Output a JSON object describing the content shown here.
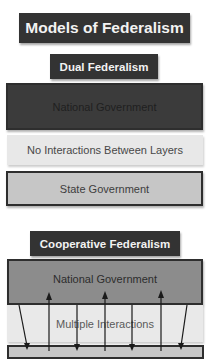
{
  "diagram": {
    "title": "Models of Federalism",
    "dual": {
      "label": "Dual Federalism",
      "layers": {
        "national": "National Government",
        "interaction": "No Interactions Between Layers",
        "state": "State Government"
      }
    },
    "cooperative": {
      "label": "Cooperative Federalism",
      "layers": {
        "national": "National Government",
        "interaction": "Multiple Interactions"
      },
      "arrows": [
        {
          "direction": "down",
          "type": "diagonal",
          "from": "national",
          "to": "state"
        },
        {
          "direction": "up",
          "type": "vertical",
          "from": "state",
          "to": "national"
        },
        {
          "direction": "down",
          "type": "vertical",
          "from": "national",
          "to": "state"
        },
        {
          "direction": "up",
          "type": "vertical",
          "from": "state",
          "to": "national"
        },
        {
          "direction": "down",
          "type": "vertical",
          "from": "national",
          "to": "state"
        },
        {
          "direction": "up",
          "type": "vertical",
          "from": "state",
          "to": "national"
        },
        {
          "direction": "down",
          "type": "diagonal",
          "from": "national",
          "to": "state"
        }
      ]
    },
    "colors": {
      "label_bg": "#333333",
      "label_text": "#f2f2f2",
      "dual_national_bg": "#3b3b3b",
      "interaction_bg": "#e8e8e8",
      "state_bg": "#c6c6c6",
      "coop_national_bg": "#8c8c8c",
      "border": "#2e2e2e"
    }
  }
}
